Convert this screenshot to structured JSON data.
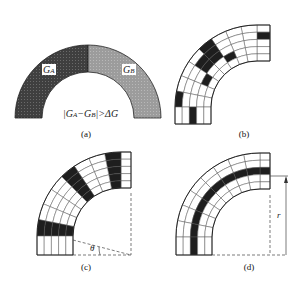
{
  "panels": {
    "a": {
      "label": "(a)",
      "region_a": "G",
      "region_a_sub": "A",
      "region_b": "G",
      "region_b_sub": "B",
      "condition": "|G",
      "condition_sub_a": "A",
      "condition_mid": "−G",
      "condition_sub_b": "B",
      "condition_end": "|>ΔG",
      "colors": {
        "region_a": "#4a4a4a",
        "region_b": "#9a9a9a"
      }
    },
    "b": {
      "label": "(b)"
    },
    "c": {
      "label": "(c)",
      "angle_symbol": "θ"
    },
    "d": {
      "label": "(d)",
      "radius_symbol": "r"
    }
  },
  "grid": {
    "rings": 5,
    "segments": 10,
    "dark_color": "#1e1e1e",
    "b_dark_cells": [
      [
        0,
        1
      ],
      [
        3,
        3
      ],
      [
        4,
        0
      ],
      [
        4,
        1
      ],
      [
        5,
        1
      ],
      [
        5,
        2
      ],
      [
        4,
        2
      ],
      [
        6,
        3
      ],
      [
        8,
        0
      ],
      [
        9,
        2
      ]
    ],
    "c_dark_segments": [
      1,
      4,
      8
    ],
    "d_dark_ring": 2
  }
}
